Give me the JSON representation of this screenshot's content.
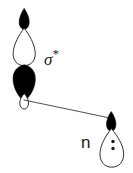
{
  "figure": {
    "kind": "orbital-interaction-diagram",
    "width": 133,
    "height": 173,
    "background_color": "#ffffff",
    "stroke_color": "#1a1a1a",
    "fill_dark_color": "#000000",
    "fill_light_color": "#ffffff"
  },
  "labels": {
    "sigma_star": "σ",
    "sigma_star_superscript": "*",
    "lone_pair": "n"
  },
  "orbitals": [
    {
      "id": "sigma-star-orbital",
      "label": "σ*",
      "type": "antibonding-sigma-star",
      "lobe_count": 4,
      "lobes": [
        {
          "name": "top-small-black-lobe",
          "phase": "dark",
          "size": "small",
          "center_x": 24,
          "center_y": 19
        },
        {
          "name": "upper-large-white-lobe",
          "phase": "light",
          "size": "large",
          "center_x": 24,
          "center_y": 47
        },
        {
          "name": "lower-large-black-lobe",
          "phase": "dark",
          "size": "large",
          "center_x": 24,
          "center_y": 78
        },
        {
          "name": "bottom-small-white-lobe",
          "phase": "light",
          "size": "small",
          "center_x": 24,
          "center_y": 101
        }
      ]
    },
    {
      "id": "lone-pair-orbital",
      "label": "n",
      "type": "nonbonding-lone-pair",
      "lobe_count": 2,
      "electron_dots": 2,
      "lobes": [
        {
          "name": "top-small-black-lobe",
          "phase": "dark",
          "size": "small",
          "center_x": 111,
          "center_y": 122
        },
        {
          "name": "main-large-white-lobe",
          "phase": "light",
          "size": "large",
          "center_x": 112,
          "center_y": 146
        }
      ],
      "dots": [
        {
          "name": "electron-dot-upper",
          "cx": 113,
          "cy": 141,
          "r": 1.6
        },
        {
          "name": "electron-dot-lower",
          "cx": 113,
          "cy": 148,
          "r": 1.6
        }
      ]
    }
  ],
  "interaction_line": {
    "name": "donation-line",
    "from_x": 24,
    "from_y": 100,
    "to_x": 110,
    "to_y": 118,
    "stroke_width": 0.9,
    "color": "#3a3a3a"
  }
}
